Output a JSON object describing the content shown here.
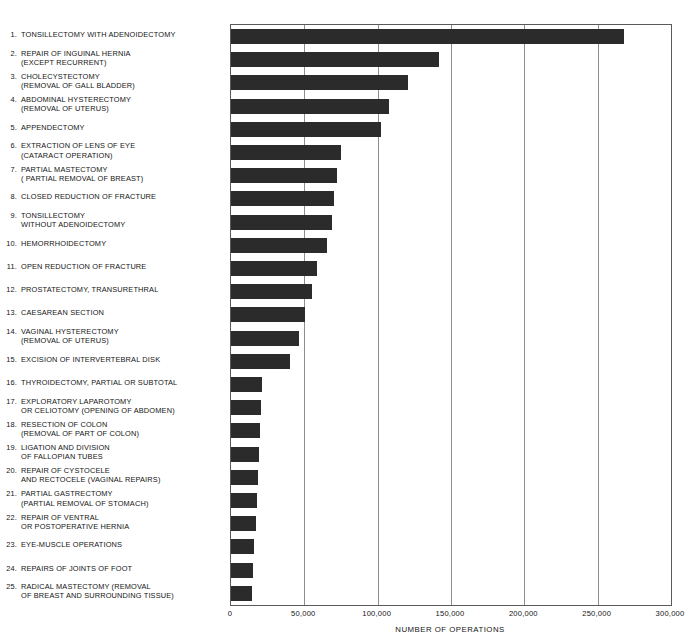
{
  "chart_data": {
    "type": "bar",
    "orientation": "horizontal",
    "title": "",
    "xlabel": "NUMBER OF OPERATIONS",
    "ylabel": "",
    "xlim": [
      0,
      300000
    ],
    "xticks": [
      0,
      50000,
      100000,
      150000,
      200000,
      250000,
      300000
    ],
    "xtick_labels": [
      "0",
      "50,000",
      "100,000",
      "150,000",
      "200,000",
      "250,000",
      "300,000"
    ],
    "grid": true,
    "grid_axis": "x",
    "legend": null,
    "bar_color": "#2b2b2b",
    "categories": [
      "TONSILLECTOMY WITH ADENOIDECTOMY",
      "REPAIR OF INGUINAL HERNIA\n(EXCEPT RECURRENT)",
      "CHOLECYSTECTOMY\n(REMOVAL OF GALL BLADDER)",
      "ABDOMINAL HYSTERECTOMY\n(REMOVAL OF UTERUS)",
      "APPENDECTOMY",
      "EXTRACTION OF LENS OF EYE\n(CATARACT OPERATION)",
      "PARTIAL MASTECTOMY\n( PARTIAL REMOVAL OF BREAST)",
      "CLOSED REDUCTION OF FRACTURE",
      "TONSILLECTOMY\nWITHOUT ADENOIDECTOMY",
      "HEMORRHOIDECTOMY",
      "OPEN REDUCTION OF FRACTURE",
      "PROSTATECTOMY, TRANSURETHRAL",
      "CAESAREAN SECTION",
      "VAGINAL HYSTERECTOMY\n(REMOVAL OF UTERUS)",
      "EXCISION OF INTERVERTEBRAL DISK",
      "THYROIDECTOMY, PARTIAL OR SUBTOTAL",
      "EXPLORATORY LAPAROTOMY\nOR CELIOTOMY (OPENING OF ABDOMEN)",
      "RESECTION OF COLON\n(REMOVAL OF PART OF COLON)",
      "LIGATION AND DIVISION\nOF FALLOPIAN TUBES",
      "REPAIR OF CYSTOCELE\nAND RECTOCELE (VAGINAL REPAIRS)",
      "PARTIAL GASTRECTOMY\n(PARTIAL REMOVAL OF STOMACH)",
      "REPAIR OF VENTRAL\nOR POSTOPERATIVE HERNIA",
      "EYE-MUSCLE OPERATIONS",
      "REPAIRS OF JOINTS OF FOOT",
      "RADICAL MASTECTOMY (REMOVAL\nOF BREAST AND SURROUNDING TISSUE)"
    ],
    "rank_labels": [
      "1.",
      "2.",
      "3.",
      "4.",
      "5.",
      "6.",
      "7.",
      "8.",
      "9.",
      "10.",
      "11.",
      "12.",
      "13.",
      "14.",
      "15.",
      "16.",
      "17.",
      "18.",
      "19.",
      "20.",
      "21.",
      "22.",
      "23.",
      "24.",
      "25."
    ],
    "values": [
      268000,
      142000,
      120500,
      108000,
      102000,
      75000,
      72000,
      70000,
      69000,
      65500,
      58500,
      55000,
      50500,
      46500,
      40000,
      21000,
      20500,
      19500,
      19000,
      18500,
      17500,
      17000,
      16000,
      15000,
      14000
    ]
  }
}
